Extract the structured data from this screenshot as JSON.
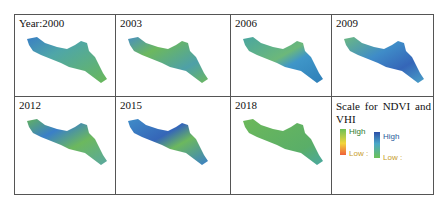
{
  "figure": {
    "panels": [
      {
        "label": "Year:2000",
        "dominant": "green",
        "blue_patches": "west"
      },
      {
        "label": "2003",
        "dominant": "green",
        "blue_patches": "center"
      },
      {
        "label": "2006",
        "dominant": "teal-blue",
        "blue_patches": "east"
      },
      {
        "label": "2009",
        "dominant": "blue",
        "blue_patches": "center-east"
      },
      {
        "label": "2012",
        "dominant": "green-blue",
        "blue_patches": "west"
      },
      {
        "label": "2015",
        "dominant": "blue",
        "blue_patches": "scattered"
      },
      {
        "label": "2018",
        "dominant": "green",
        "blue_patches": "none"
      }
    ],
    "legend": {
      "title": "Scale for NDVI and VHI",
      "ndvi": {
        "high_label": "High",
        "low_label": "Low :",
        "colors": [
          "#6cbf55",
          "#f2d53a",
          "#f0603a"
        ]
      },
      "vhi": {
        "high_label": "High",
        "low_label": "Low :",
        "colors": [
          "#2c4fa8",
          "#4aa8c8",
          "#6cc257"
        ]
      }
    }
  }
}
